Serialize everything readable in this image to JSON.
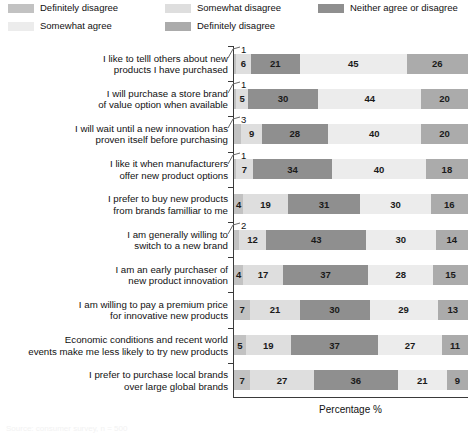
{
  "legend": {
    "items": [
      {
        "label": "Definitely disagree",
        "color": "#c2c2c2",
        "swatch_name": "legend-swatch-definitely-disagree"
      },
      {
        "label": "Somewhat disagree",
        "color": "#dedede",
        "swatch_name": "legend-swatch-somewhat-disagree"
      },
      {
        "label": "Neither agree or disagree",
        "color": "#8f8f8f",
        "swatch_name": "legend-swatch-neither-agree-or-disagree"
      },
      {
        "label": "Somewhat agree",
        "color": "#ececec",
        "swatch_name": "legend-swatch-somewhat-agree"
      },
      {
        "label": "Definitely disagree",
        "color": "#ababab",
        "swatch_name": "legend-swatch-definitely-agree"
      }
    ]
  },
  "axis": {
    "x_title": "Percentage %"
  },
  "footnote": {
    "text": "Source: consumer survey, n = 500"
  },
  "chart_data": {
    "type": "bar",
    "subtype": "stacked-horizontal-100",
    "title": "",
    "xlabel": "Percentage %",
    "ylabel": "",
    "xlim": [
      0,
      100
    ],
    "grid": false,
    "legend_position": "top",
    "categories": [
      "I like to telll others about new products I have purchased",
      "I will purchase a store brand of value option when available",
      "I will wait until a new innovation has proven itself before purchasing",
      "I like it when manufacturers offer new product options",
      "I prefer to buy new products from brands familliar to me",
      "I am generally willing to switch to a new brand",
      "I am an early purchaser of new product innovation",
      "I am willing to pay a premium price for innovative new products",
      "Economic conditions and recent world events make me less likely to try new products",
      "I prefer to purchase local brands over large global brands"
    ],
    "series": [
      {
        "name": "Definitely disagree",
        "color": "#c2c2c2",
        "values": [
          1,
          1,
          3,
          1,
          4,
          2,
          4,
          7,
          5,
          7
        ]
      },
      {
        "name": "Somewhat disagree",
        "color": "#dedede",
        "values": [
          6,
          5,
          9,
          7,
          19,
          12,
          17,
          21,
          19,
          27
        ]
      },
      {
        "name": "Neither agree or disagree",
        "color": "#8f8f8f",
        "values": [
          21,
          30,
          28,
          34,
          31,
          43,
          37,
          30,
          37,
          36
        ]
      },
      {
        "name": "Somewhat agree",
        "color": "#ececec",
        "values": [
          45,
          44,
          40,
          40,
          30,
          30,
          28,
          29,
          27,
          21
        ]
      },
      {
        "name": "Definitely agree",
        "color": "#ababab",
        "values": [
          26,
          20,
          20,
          18,
          16,
          14,
          15,
          13,
          11,
          9
        ]
      }
    ]
  },
  "rows": [
    {
      "label_lines": [
        "I like to telll others about new",
        "products I have purchased"
      ],
      "segments": [
        {
          "value": 1,
          "color": "#c2c2c2",
          "external": true
        },
        {
          "value": 6,
          "color": "#dedede",
          "external": false
        },
        {
          "value": 21,
          "color": "#8f8f8f",
          "external": false
        },
        {
          "value": 45,
          "color": "#ececec",
          "external": false
        },
        {
          "value": 26,
          "color": "#ababab",
          "external": false
        }
      ]
    },
    {
      "label_lines": [
        "I will purchase a store brand",
        "of value option when available"
      ],
      "segments": [
        {
          "value": 1,
          "color": "#c2c2c2",
          "external": true
        },
        {
          "value": 5,
          "color": "#dedede",
          "external": false
        },
        {
          "value": 30,
          "color": "#8f8f8f",
          "external": false
        },
        {
          "value": 44,
          "color": "#ececec",
          "external": false
        },
        {
          "value": 20,
          "color": "#ababab",
          "external": false
        }
      ]
    },
    {
      "label_lines": [
        "I will wait until a new innovation has",
        "proven itself before purchasing"
      ],
      "segments": [
        {
          "value": 3,
          "color": "#c2c2c2",
          "external": true
        },
        {
          "value": 9,
          "color": "#dedede",
          "external": false
        },
        {
          "value": 28,
          "color": "#8f8f8f",
          "external": false
        },
        {
          "value": 40,
          "color": "#ececec",
          "external": false
        },
        {
          "value": 20,
          "color": "#ababab",
          "external": false
        }
      ]
    },
    {
      "label_lines": [
        "I like it when manufacturers",
        "offer new product options"
      ],
      "segments": [
        {
          "value": 1,
          "color": "#c2c2c2",
          "external": true
        },
        {
          "value": 7,
          "color": "#dedede",
          "external": false
        },
        {
          "value": 34,
          "color": "#8f8f8f",
          "external": false
        },
        {
          "value": 40,
          "color": "#ececec",
          "external": false
        },
        {
          "value": 18,
          "color": "#ababab",
          "external": false
        }
      ]
    },
    {
      "label_lines": [
        "I prefer to buy new products",
        "from brands familliar to me"
      ],
      "segments": [
        {
          "value": 4,
          "color": "#c2c2c2",
          "external": false
        },
        {
          "value": 19,
          "color": "#dedede",
          "external": false
        },
        {
          "value": 31,
          "color": "#8f8f8f",
          "external": false
        },
        {
          "value": 30,
          "color": "#ececec",
          "external": false
        },
        {
          "value": 16,
          "color": "#ababab",
          "external": false
        }
      ]
    },
    {
      "label_lines": [
        "I am generally willing to",
        "switch to a new brand"
      ],
      "segments": [
        {
          "value": 2,
          "color": "#c2c2c2",
          "external": true
        },
        {
          "value": 12,
          "color": "#dedede",
          "external": false
        },
        {
          "value": 43,
          "color": "#8f8f8f",
          "external": false
        },
        {
          "value": 30,
          "color": "#ececec",
          "external": false
        },
        {
          "value": 14,
          "color": "#ababab",
          "external": false
        }
      ]
    },
    {
      "label_lines": [
        "I am an early purchaser of",
        "new product innovation"
      ],
      "segments": [
        {
          "value": 4,
          "color": "#c2c2c2",
          "external": false
        },
        {
          "value": 17,
          "color": "#dedede",
          "external": false
        },
        {
          "value": 37,
          "color": "#8f8f8f",
          "external": false
        },
        {
          "value": 28,
          "color": "#ececec",
          "external": false
        },
        {
          "value": 15,
          "color": "#ababab",
          "external": false
        }
      ]
    },
    {
      "label_lines": [
        "I am willing to pay a premium price",
        "for innovative new products"
      ],
      "segments": [
        {
          "value": 7,
          "color": "#c2c2c2",
          "external": false
        },
        {
          "value": 21,
          "color": "#dedede",
          "external": false
        },
        {
          "value": 30,
          "color": "#8f8f8f",
          "external": false
        },
        {
          "value": 29,
          "color": "#ececec",
          "external": false
        },
        {
          "value": 13,
          "color": "#ababab",
          "external": false
        }
      ]
    },
    {
      "label_lines": [
        "Economic conditions and recent world",
        "events make me less likely to try new products"
      ],
      "segments": [
        {
          "value": 5,
          "color": "#c2c2c2",
          "external": false
        },
        {
          "value": 19,
          "color": "#dedede",
          "external": false
        },
        {
          "value": 37,
          "color": "#8f8f8f",
          "external": false
        },
        {
          "value": 27,
          "color": "#ececec",
          "external": false
        },
        {
          "value": 11,
          "color": "#ababab",
          "external": false
        }
      ]
    },
    {
      "label_lines": [
        "I prefer to purchase local brands",
        "over large global brands"
      ],
      "segments": [
        {
          "value": 7,
          "color": "#c2c2c2",
          "external": false
        },
        {
          "value": 27,
          "color": "#dedede",
          "external": false
        },
        {
          "value": 36,
          "color": "#8f8f8f",
          "external": false
        },
        {
          "value": 21,
          "color": "#ececec",
          "external": false
        },
        {
          "value": 9,
          "color": "#ababab",
          "external": false
        }
      ]
    }
  ]
}
